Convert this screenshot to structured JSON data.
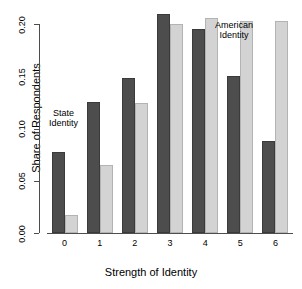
{
  "chart_data": {
    "type": "bar",
    "title": "",
    "xlabel": "Strength of Identity",
    "ylabel": "Share of Respondents",
    "categories": [
      "0",
      "1",
      "2",
      "3",
      "4",
      "5",
      "6"
    ],
    "ylim": [
      0.0,
      0.2
    ],
    "yticks": [
      "0.00",
      "0.05",
      "0.10",
      "0.15",
      "0.20"
    ],
    "ytick_values": [
      0.0,
      0.05,
      0.1,
      0.15,
      0.2
    ],
    "grid": false,
    "legend_position": "inline-annotations",
    "series": [
      {
        "name": "State Identity",
        "color": "#4d4d4d",
        "values": [
          0.078,
          0.125,
          0.148,
          0.21,
          0.195,
          0.15,
          0.088
        ]
      },
      {
        "name": "American Identity",
        "color": "#d3d3d3",
        "values": [
          0.017,
          0.065,
          0.124,
          0.2,
          0.206,
          0.203,
          0.203
        ]
      }
    ],
    "annotations": [
      {
        "text": "State\nIdentity",
        "series": "State Identity"
      },
      {
        "text": "American\nIdentity",
        "series": "American Identity"
      }
    ]
  },
  "annotations": {
    "state_line1": "State",
    "state_line2": "Identity",
    "american_line1": "American",
    "american_line2": "Identity"
  }
}
